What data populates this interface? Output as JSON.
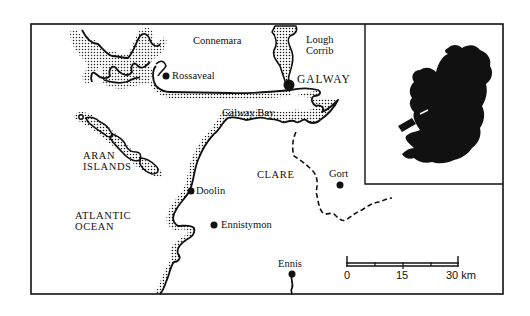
{
  "map": {
    "regions": {
      "connemara": "Connemara",
      "lough_corrib_line1": "Lough",
      "lough_corrib_line2": "Corrib",
      "galway_bay": "Galway Bay",
      "aran_line1": "ARAN",
      "aran_line2": "ISLANDS",
      "clare": "CLARE",
      "atlantic_line1": "ATLANTIC",
      "atlantic_line2": "OCEAN"
    },
    "towns": [
      {
        "name": "Rossaveal"
      },
      {
        "name": "GALWAY"
      },
      {
        "name": "Doolin"
      },
      {
        "name": "Ennistymon"
      },
      {
        "name": "Gort"
      },
      {
        "name": "Ennis"
      }
    ],
    "scale_bar": {
      "ticks": [
        "0",
        "15",
        "30 km"
      ]
    },
    "inset": {
      "subject": "Ireland outline with arrow indicating Galway Bay area"
    },
    "colors": {
      "ink": "#111111",
      "background": "#ffffff"
    }
  }
}
